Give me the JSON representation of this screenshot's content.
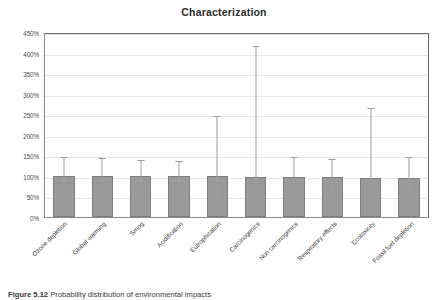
{
  "figure": {
    "background": "#ffffff",
    "caption": {
      "label": "Figure 5.12",
      "text": "Probability distribution of environmental impacts"
    }
  },
  "chart_data": {
    "type": "bar",
    "title": "Characterization",
    "xlabel": "",
    "ylabel": "",
    "ylim": [
      0,
      450
    ],
    "ytick_labels": [
      "0%",
      "50%",
      "100%",
      "150%",
      "200%",
      "250%",
      "300%",
      "350%",
      "400%",
      "450%"
    ],
    "ytick_values": [
      0,
      50,
      100,
      150,
      200,
      250,
      300,
      350,
      400,
      450
    ],
    "unit": "%",
    "grid": "horizontal",
    "legend": "none",
    "bar_color": "#9a9a9a",
    "bar_edge_color": "#7d7d7d",
    "error_bar_color": "#9d9d9d",
    "categories": [
      "Ozone depletion",
      "Global warming",
      "Smog",
      "Acidification",
      "Eutrophication",
      "Carcinogenics",
      "Non carcinogenics",
      "Respiratory effects",
      "Ecotoxicity",
      "Fossil fuel depletion"
    ],
    "values": [
      100,
      100,
      100,
      99,
      99,
      98,
      97,
      97,
      96,
      95
    ],
    "error_upper": [
      152,
      148,
      143,
      140,
      250,
      420,
      152,
      145,
      270,
      152
    ],
    "error_lower": [
      57,
      63,
      60,
      62,
      52,
      28,
      55,
      57,
      40,
      63
    ],
    "series": [
      {
        "name": "Characterization",
        "values": [
          100,
          100,
          100,
          99,
          99,
          98,
          97,
          97,
          96,
          95
        ]
      }
    ]
  }
}
